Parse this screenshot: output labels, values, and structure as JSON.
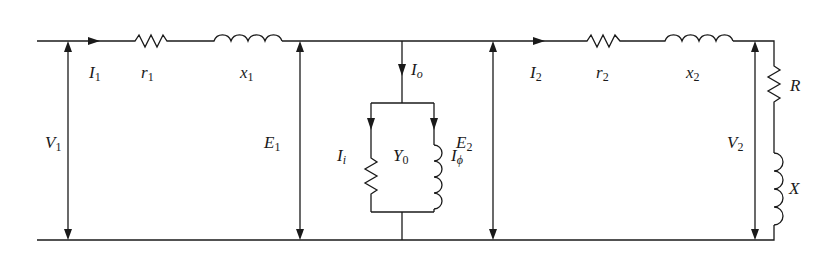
{
  "diagram": {
    "type": "equivalent-circuit",
    "stroke_color": "#1a1a1a",
    "background": "#ffffff",
    "components": [
      {
        "id": "r1",
        "kind": "resistor",
        "label": "r",
        "sub": "1"
      },
      {
        "id": "x1",
        "kind": "inductor",
        "label": "x",
        "sub": "1"
      },
      {
        "id": "Y0_resistive",
        "kind": "resistor",
        "branch": "Y0"
      },
      {
        "id": "Y0_inductive",
        "kind": "inductor",
        "branch": "Y0"
      },
      {
        "id": "r2",
        "kind": "resistor",
        "label": "r",
        "sub": "2"
      },
      {
        "id": "x2",
        "kind": "inductor",
        "label": "x",
        "sub": "2"
      },
      {
        "id": "R",
        "kind": "resistor",
        "label": "R"
      },
      {
        "id": "X",
        "kind": "inductor",
        "label": "X"
      }
    ],
    "labels": {
      "I1": {
        "main": "I",
        "sub": "1"
      },
      "r1": {
        "main": "r",
        "sub": "1"
      },
      "x1": {
        "main": "x",
        "sub": "1"
      },
      "V1": {
        "main": "V",
        "sub": "1"
      },
      "E1": {
        "main": "E",
        "sub": "1"
      },
      "Io": {
        "main": "I",
        "sub": "o"
      },
      "Ii": {
        "main": "I",
        "sub": "i"
      },
      "Y0": {
        "main": "Y",
        "sub": "0"
      },
      "Iphi": {
        "main": "I",
        "sub": "ϕ"
      },
      "E2": {
        "main": "E",
        "sub": "2"
      },
      "I2": {
        "main": "I",
        "sub": "2"
      },
      "r2": {
        "main": "r",
        "sub": "2"
      },
      "x2": {
        "main": "x",
        "sub": "2"
      },
      "V2": {
        "main": "V",
        "sub": "2"
      },
      "R": {
        "main": "R"
      },
      "X": {
        "main": "X"
      }
    }
  }
}
